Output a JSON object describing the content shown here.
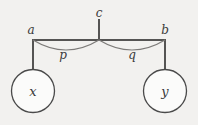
{
  "diagram": {
    "type": "tree-with-arcs",
    "background_color": "#f2f1ef",
    "line_color": "#555453",
    "arc_color": "#7d7b79",
    "node_fill_color": "#fbfbfa",
    "node_stroke_color": "#4a4a4a",
    "text_color": "#3a3a3a",
    "root": {
      "label": "c",
      "x": 99,
      "y": 13
    },
    "bar": {
      "y": 40,
      "x_start": 33,
      "x_end": 165
    },
    "stem": {
      "x": 99,
      "y_top": 20,
      "y_bottom": 40
    },
    "branch_nodes": [
      {
        "label": "a",
        "x": 31,
        "y": 30,
        "drop_x": 33,
        "drop_y_top": 40,
        "drop_y_bottom": 69
      },
      {
        "label": "b",
        "x": 165,
        "y": 30,
        "drop_x": 165,
        "drop_y_top": 40,
        "drop_y_bottom": 69
      }
    ],
    "arcs": [
      {
        "label": "p",
        "label_x": 63,
        "label_y": 55,
        "x_start": 33,
        "x_end": 99,
        "y": 40,
        "sag": 10
      },
      {
        "label": "q",
        "label_x": 132,
        "label_y": 55,
        "x_start": 99,
        "x_end": 165,
        "y": 40,
        "sag": 10
      }
    ],
    "leaves": [
      {
        "label": "x",
        "cx": 33,
        "cy": 91,
        "r": 21.5
      },
      {
        "label": "y",
        "cx": 165,
        "cy": 91,
        "r": 21.5
      }
    ]
  }
}
